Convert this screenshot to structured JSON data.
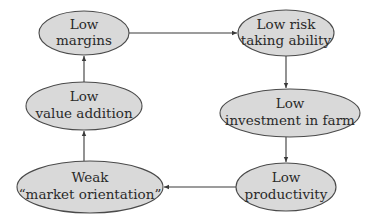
{
  "diagram": {
    "type": "cycle",
    "nodes": [
      {
        "id": "low-margins",
        "lines": [
          "Low",
          "margins"
        ],
        "cx": 84,
        "cy": 33,
        "rx": 45,
        "ry": 22
      },
      {
        "id": "low-risk-taking",
        "lines": [
          "Low risk",
          "taking ability"
        ],
        "cx": 286,
        "cy": 33,
        "rx": 48,
        "ry": 23
      },
      {
        "id": "low-investment",
        "lines": [
          "Low",
          "investment in farm"
        ],
        "cx": 290,
        "cy": 113,
        "rx": 70,
        "ry": 24
      },
      {
        "id": "low-productivity",
        "lines": [
          "Low",
          "productivity"
        ],
        "cx": 286,
        "cy": 187,
        "rx": 50,
        "ry": 24
      },
      {
        "id": "weak-market-orientation",
        "lines": [
          "Weak",
          "“market orientation”"
        ],
        "cx": 90,
        "cy": 187,
        "rx": 73,
        "ry": 26
      },
      {
        "id": "low-value-addition",
        "lines": [
          "Low",
          "value addition"
        ],
        "cx": 84,
        "cy": 106,
        "rx": 58,
        "ry": 24
      }
    ],
    "edges": [
      {
        "from": "low-margins",
        "to": "low-risk-taking"
      },
      {
        "from": "low-risk-taking",
        "to": "low-investment"
      },
      {
        "from": "low-investment",
        "to": "low-productivity"
      },
      {
        "from": "low-productivity",
        "to": "weak-market-orientation"
      },
      {
        "from": "weak-market-orientation",
        "to": "low-value-addition"
      },
      {
        "from": "low-value-addition",
        "to": "low-margins"
      }
    ],
    "colors": {
      "node_fill": "#d9d9d9",
      "node_stroke": "#4a4a4a",
      "edge": "#3a3a3a",
      "text": "#2a2a2a"
    }
  }
}
